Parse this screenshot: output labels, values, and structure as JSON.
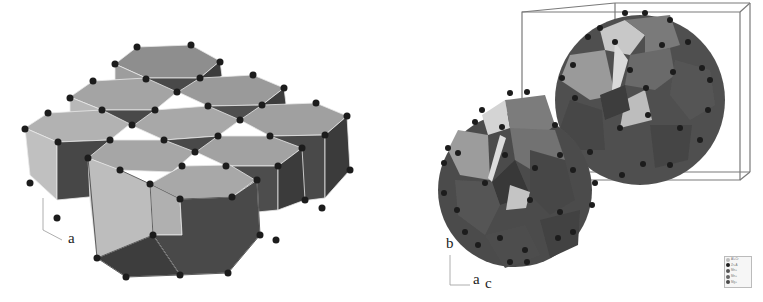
{
  "figure": {
    "left_panel": {
      "description": "Packed hexagonal prism polyhedra crystal structure",
      "axis_labels": {
        "a": "a"
      }
    },
    "right_panel": {
      "description": "Two large polyhedral clusters within unit cell box",
      "axis_labels": {
        "b": "b",
        "a": "a",
        "c": "c"
      },
      "legend": {
        "entries": [
          {
            "label": "Al+Cr",
            "color": "#bdbdbd"
          },
          {
            "label": "Zr+A",
            "color": "#1e1e1e"
          },
          {
            "label": "Mn+",
            "color": "#555555"
          },
          {
            "label": "Mn+",
            "color": "#666666"
          },
          {
            "label": "Mg+",
            "color": "#4a4a4a"
          }
        ]
      }
    }
  },
  "colors": {
    "light_face": "#b8b8b8",
    "mid_face": "#8e8e8e",
    "dark_face": "#505050",
    "darker_face": "#3c3c3c",
    "atom": "#1c1c1c",
    "cell_box": "#777777"
  }
}
